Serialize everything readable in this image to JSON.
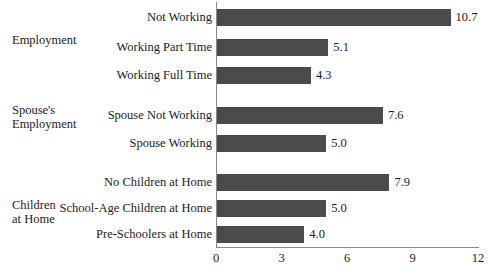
{
  "chart_data": {
    "type": "bar",
    "orientation": "horizontal",
    "title": "",
    "xlabel": "",
    "ylabel": "",
    "xlim": [
      0,
      12
    ],
    "xticks": [
      "0",
      "3",
      "6",
      "9",
      "12"
    ],
    "grid": false,
    "legend": null,
    "bar_color": "#4b4b4b",
    "groups": [
      {
        "name": "Employment",
        "label_lines": [
          "Employment"
        ],
        "categories": [
          "Not Working",
          "Working Part Time",
          "Working Full Time"
        ],
        "values": [
          10.7,
          5.1,
          4.3
        ],
        "value_labels": [
          "10.7",
          "5.1",
          "4.3"
        ]
      },
      {
        "name": "Spouse's Employment",
        "label_lines": [
          "Spouse's",
          "Employment"
        ],
        "categories": [
          "Spouse Not Working",
          "Spouse Working"
        ],
        "values": [
          7.6,
          5.0
        ],
        "value_labels": [
          "7.6",
          "5.0"
        ]
      },
      {
        "name": "Children at Home",
        "label_lines": [
          "Children",
          "at Home"
        ],
        "categories": [
          "No Children at Home",
          "School-Age Children at Home",
          "Pre-Schoolers at Home"
        ],
        "values": [
          7.9,
          5.0,
          4.0
        ],
        "value_labels": [
          "7.9",
          "5.0",
          "4.0"
        ]
      }
    ],
    "categories": [
      "Not Working",
      "Working Part Time",
      "Working Full Time",
      "Spouse Not Working",
      "Spouse Working",
      "No Children at Home",
      "School-Age Children at Home",
      "Pre-Schoolers at Home"
    ],
    "values": [
      10.7,
      5.1,
      4.3,
      7.6,
      5.0,
      7.9,
      5.0,
      4.0
    ]
  },
  "rows": [
    {
      "label": "Not Working",
      "value": 10.7,
      "value_label": "10.7",
      "top": 8
    },
    {
      "label": "Working Part Time",
      "value": 5.1,
      "value_label": "5.1",
      "top": 38
    },
    {
      "label": "Working Full Time",
      "value": 4.3,
      "value_label": "4.3",
      "top": 66
    },
    {
      "label": "Spouse Not Working",
      "value": 7.6,
      "value_label": "7.6",
      "top": 106
    },
    {
      "label": "Spouse Working",
      "value": 5.0,
      "value_label": "5.0",
      "top": 134
    },
    {
      "label": "No Children at Home",
      "value": 7.9,
      "value_label": "7.9",
      "top": 173
    },
    {
      "label": "School-Age Children at Home",
      "value": 5.0,
      "value_label": "5.0",
      "top": 199
    },
    {
      "label": "Pre-Schoolers at Home",
      "value": 4.0,
      "value_label": "4.0",
      "top": 225
    }
  ],
  "group_labels": [
    {
      "lines": [
        "Employment"
      ],
      "top": 33
    },
    {
      "lines": [
        "Spouse's",
        "Employment"
      ],
      "top": 103
    },
    {
      "lines": [
        "Children",
        "at Home"
      ],
      "top": 198
    }
  ],
  "x_axis": {
    "ticks": [
      {
        "label": "0",
        "value": 0
      },
      {
        "label": "3",
        "value": 3
      },
      {
        "label": "6",
        "value": 6
      },
      {
        "label": "9",
        "value": 9
      },
      {
        "label": "12",
        "value": 12
      }
    ]
  },
  "caption": {
    "text": ""
  }
}
